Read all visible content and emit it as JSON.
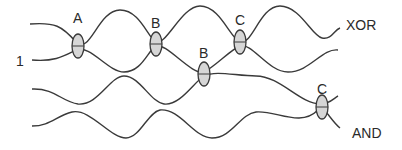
{
  "diagram": {
    "type": "braid-like wire diagram with gate interactions",
    "input_label": "1",
    "outputs": {
      "top": "XOR",
      "bottom": "AND"
    },
    "gates": [
      {
        "label": "A",
        "between": "wire1-wire2"
      },
      {
        "label": "B",
        "between": "wire1-wire2"
      },
      {
        "label": "B",
        "between": "wire2-wire3"
      },
      {
        "label": "C",
        "between": "wire1-wire2"
      },
      {
        "label": "C",
        "between": "wire3-wire4"
      }
    ],
    "wire_count": 4,
    "colors": {
      "stroke": "#3a3a3a",
      "gate_fill": "#d6d6d6"
    }
  }
}
